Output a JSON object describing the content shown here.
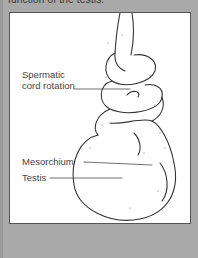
{
  "caption": {
    "text": "function of the testis."
  },
  "figure": {
    "labels": [
      {
        "id": "spermatic-cord-rotation",
        "line1": "Spermatic",
        "line2": "cord rotation"
      },
      {
        "id": "mesorchium",
        "text": "Mesorchium"
      },
      {
        "id": "testis",
        "text": "Testis"
      }
    ]
  },
  "colors": {
    "background": "#a9a9a9",
    "figure_bg": "#ffffff",
    "line": "#333333"
  }
}
